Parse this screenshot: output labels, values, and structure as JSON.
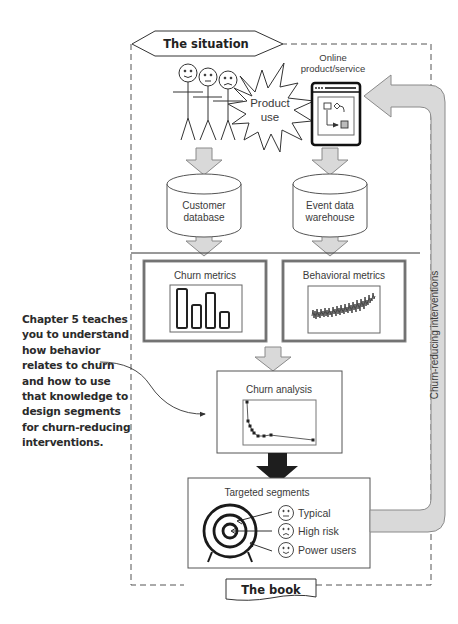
{
  "diagram": {
    "top_banner": "The situation",
    "bottom_banner": "The book",
    "product_use_label": "Product use",
    "product_use_lines": [
      "Product",
      "use"
    ],
    "online_product": {
      "lines": [
        "Online",
        "product/service"
      ]
    },
    "customer_database": {
      "lines": [
        "Customer",
        "database"
      ]
    },
    "event_warehouse": {
      "lines": [
        "Event data",
        "warehouse"
      ]
    },
    "churn_metrics": {
      "title": "Churn metrics",
      "bars": [
        0.92,
        0.5,
        0.82,
        0.4
      ]
    },
    "behavioral_metrics": {
      "title": "Behavioral metrics"
    },
    "churn_analysis": {
      "title": "Churn analysis"
    },
    "targeted_segments": {
      "title": "Targeted segments",
      "segments": [
        {
          "label": "Typical",
          "face": "neutral"
        },
        {
          "label": "High risk",
          "face": "sad"
        },
        {
          "label": "Power users",
          "face": "happy"
        }
      ]
    },
    "feedback_arrow_label": "Churn-reducing interventions",
    "annotation": {
      "lines": [
        "Chapter 5 teaches",
        "you to understand",
        "how behavior",
        "relates to churn",
        "and how to use",
        "that knowledge to",
        "design segments",
        "for churn-reducing",
        "interventions."
      ]
    }
  },
  "colors": {
    "arrow_fill": "#d9d9d9",
    "arrow_stroke": "#8a8a8a",
    "line": "#444444",
    "dark_arrow": "#1e1e1e"
  }
}
